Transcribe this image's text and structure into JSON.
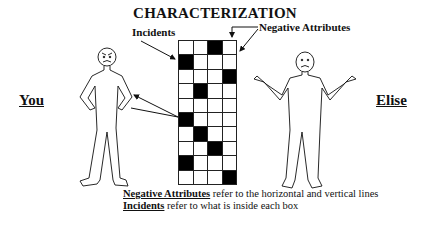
{
  "title": "CHARACTERIZATION",
  "labels": {
    "incidents": "Incidents",
    "negative_attributes": "Negative Attributes",
    "left_person": "You",
    "right_person": "Elise"
  },
  "figures": {
    "left": {
      "name": "You",
      "expression": "angry",
      "pose": "hands-on-hips"
    },
    "right": {
      "name": "Elise",
      "expression": "sad",
      "pose": "shrugging"
    }
  },
  "grid": {
    "columns": 4,
    "rows": 10,
    "filled": [
      [
        0,
        0,
        1,
        0
      ],
      [
        1,
        0,
        0,
        0
      ],
      [
        0,
        0,
        0,
        1
      ],
      [
        0,
        1,
        0,
        0
      ],
      [
        0,
        0,
        0,
        0
      ],
      [
        1,
        0,
        0,
        0
      ],
      [
        0,
        1,
        0,
        0
      ],
      [
        0,
        0,
        1,
        0
      ],
      [
        1,
        0,
        0,
        0
      ],
      [
        0,
        0,
        0,
        1
      ]
    ]
  },
  "caption": {
    "line1": {
      "term": "Negative Attributes",
      "text": " refer to the horizontal and vertical lines"
    },
    "line2": {
      "term": "Incidents",
      "text": " refer to what is inside each box"
    }
  }
}
